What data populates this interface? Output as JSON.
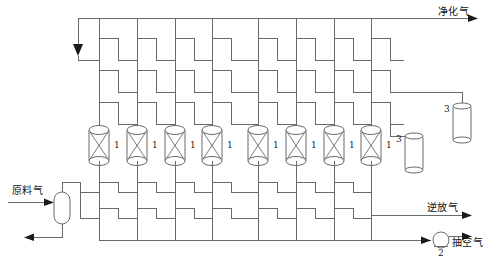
{
  "diagram": {
    "type": "process-flow-diagram",
    "canvas": {
      "width": 486,
      "height": 265
    },
    "colors": {
      "line": "#6a6a6a",
      "line_dark": "#4a4a4a",
      "arrow": "#1a1a1a",
      "text": "#111111",
      "background": "#ffffff"
    },
    "stream_labels": {
      "purified_gas": "净化气",
      "feed_gas": "原料气",
      "counter_current_gas": "逆放气",
      "evacuation_gas": "抽空气"
    },
    "equipment_tags": {
      "adsorber": "1",
      "vacuum_pump": "2",
      "buffer_tank": "3"
    },
    "adsorbers": [
      {
        "tag": "1",
        "x": 99
      },
      {
        "tag": "1",
        "x": 137
      },
      {
        "tag": "1",
        "x": 175
      },
      {
        "tag": "1",
        "x": 212
      },
      {
        "tag": "1",
        "x": 258
      },
      {
        "tag": "1",
        "x": 296
      },
      {
        "tag": "1",
        "x": 334
      },
      {
        "tag": "1",
        "x": 371
      }
    ],
    "buffer_tanks": [
      {
        "tag": "3",
        "x": 414,
        "y": 130
      },
      {
        "tag": "3",
        "x": 462,
        "y": 100
      }
    ],
    "vacuum_pump": {
      "tag": "2",
      "x": 441,
      "y": 240
    },
    "separator": {
      "x": 62,
      "y": 202
    },
    "header_rows": {
      "top_header_y": 18,
      "upper_valve_rows": [
        48,
        75,
        103
      ],
      "lower_valve_rows": [
        186,
        212
      ],
      "bottom_header_y": 240,
      "counter_current_y": 215
    }
  }
}
